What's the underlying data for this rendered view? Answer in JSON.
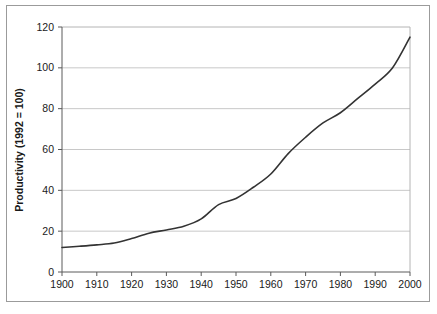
{
  "chart_data": {
    "type": "line",
    "title": "",
    "xlabel": "",
    "ylabel": "Productivity (1992 = 100)",
    "xlim": [
      1900,
      2000
    ],
    "ylim": [
      0,
      120
    ],
    "xticks": [
      1900,
      1910,
      1920,
      1930,
      1940,
      1950,
      1960,
      1970,
      1980,
      1990,
      2000
    ],
    "yticks": [
      0,
      20,
      40,
      60,
      80,
      100,
      120
    ],
    "xtick_labels": [
      "1900",
      "1910",
      "1920",
      "1930",
      "1940",
      "1950",
      "1960",
      "1970",
      "1980",
      "1990",
      "2000"
    ],
    "ytick_labels": [
      "0",
      "20",
      "40",
      "60",
      "80",
      "100",
      "120"
    ],
    "grid": "horizontal",
    "legend": "none",
    "line_color": "#333333",
    "grid_color": "#c8c8c8",
    "axis_color": "#808080",
    "plot_background": "#ffffff",
    "series": [
      {
        "name": "Productivity",
        "x": [
          1900,
          1905,
          1910,
          1915,
          1920,
          1925,
          1930,
          1935,
          1940,
          1945,
          1950,
          1955,
          1960,
          1965,
          1970,
          1975,
          1980,
          1985,
          1990,
          1995,
          2000
        ],
        "values": [
          12,
          12.6,
          13.3,
          14.2,
          16.4,
          19,
          20.6,
          22.4,
          26,
          33,
          36,
          41.5,
          48,
          58,
          66,
          73,
          78,
          85,
          92,
          100,
          115
        ]
      }
    ]
  }
}
